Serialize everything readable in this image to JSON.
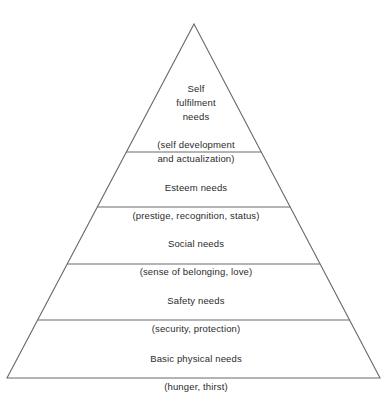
{
  "diagram": {
    "type": "pyramid",
    "name": "maslow-hierarchy-of-needs",
    "background_color": "#ffffff",
    "line_color": "#6a6a6a",
    "text_color": "#2b2b2b",
    "geometry": {
      "apex_x": 194,
      "apex_y": 24,
      "base_left_x": 7,
      "base_right_x": 380,
      "base_y": 378,
      "divider_y": [
        152,
        207,
        264,
        320
      ]
    },
    "tiers": [
      {
        "level": 5,
        "title": "Self\nfulfilment\nneeds",
        "subtitle": "(self development\nand actualization)",
        "text_top": 68
      },
      {
        "level": 4,
        "title": "Esteem needs",
        "subtitle": "(prestige, recognition, status)",
        "text_top": 167
      },
      {
        "level": 3,
        "title": "Social needs",
        "subtitle": "(sense of belonging, love)",
        "text_top": 223
      },
      {
        "level": 2,
        "title": "Safety needs",
        "subtitle": "(security, protection)",
        "text_top": 280
      },
      {
        "level": 1,
        "title": "Basic physical needs",
        "subtitle": "(hunger, thirst)",
        "text_top": 338
      }
    ]
  }
}
